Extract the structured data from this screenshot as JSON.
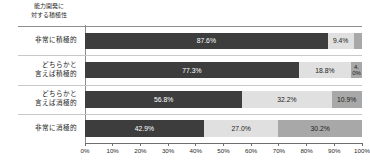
{
  "header": {
    "title_line1": "能力開発に",
    "title_line2": "対する積極性"
  },
  "axis": {
    "ticks": [
      "0%",
      "10%",
      "20%",
      "30%",
      "40%",
      "50%",
      "60%",
      "70%",
      "80%",
      "90%",
      "100%"
    ]
  },
  "colors": {
    "series1": "#3d3d3d",
    "series2": "#e0e0e0",
    "series3": "#a8a8a8",
    "series1_text": "#ffffff",
    "series2_text": "#1c1c1c",
    "series3_text": "#1c1c1c",
    "rule": "#8e8e8e",
    "row_separator": "#c9c9c9",
    "axis": "#6e6e6e",
    "background": "#ffffff"
  },
  "chart_data": {
    "type": "bar",
    "xlabel": "",
    "ylabel": "",
    "xlim": [
      0,
      100
    ],
    "grid": false,
    "legend": "none",
    "orientation": "horizontal",
    "stacked": true,
    "normalized_percent": true,
    "categories": [
      "非常に積極的",
      "どちらかと言えば積極的",
      "どちらかと言えば消極的",
      "非常に消極的"
    ],
    "series": [
      {
        "name": "series1",
        "values": [
          87.6,
          77.3,
          56.8,
          42.9
        ]
      },
      {
        "name": "series2",
        "values": [
          9.4,
          18.8,
          32.2,
          27.0
        ]
      },
      {
        "name": "series3",
        "values": [
          3.0,
          4.0,
          10.9,
          30.2
        ]
      }
    ],
    "rows": [
      {
        "label_line1": "非常に積極的",
        "label_line2": "",
        "segments": [
          {
            "value": 87.6,
            "label": "87.6%",
            "show_label": true,
            "wrap": false
          },
          {
            "value": 9.4,
            "label": "9.4%",
            "show_label": true,
            "wrap": false
          },
          {
            "value": 3.0,
            "label": "",
            "show_label": false,
            "wrap": false
          }
        ]
      },
      {
        "label_line1": "どちらかと",
        "label_line2": "言えば積極的",
        "segments": [
          {
            "value": 77.3,
            "label": "77.3%",
            "show_label": true,
            "wrap": false
          },
          {
            "value": 18.8,
            "label": "18.8%",
            "show_label": true,
            "wrap": false
          },
          {
            "value": 4.0,
            "label": "4.0%",
            "show_label": true,
            "wrap": true
          }
        ]
      },
      {
        "label_line1": "どちらかと",
        "label_line2": "言えば消極的",
        "segments": [
          {
            "value": 56.8,
            "label": "56.8%",
            "show_label": true,
            "wrap": false
          },
          {
            "value": 32.2,
            "label": "32.2%",
            "show_label": true,
            "wrap": false
          },
          {
            "value": 10.9,
            "label": "10.9%",
            "show_label": true,
            "wrap": false
          }
        ]
      },
      {
        "label_line1": "非常に消極的",
        "label_line2": "",
        "segments": [
          {
            "value": 42.9,
            "label": "42.9%",
            "show_label": true,
            "wrap": false
          },
          {
            "value": 27.0,
            "label": "27.0%",
            "show_label": true,
            "wrap": false
          },
          {
            "value": 30.2,
            "label": "30.2%",
            "show_label": true,
            "wrap": false
          }
        ]
      }
    ]
  }
}
